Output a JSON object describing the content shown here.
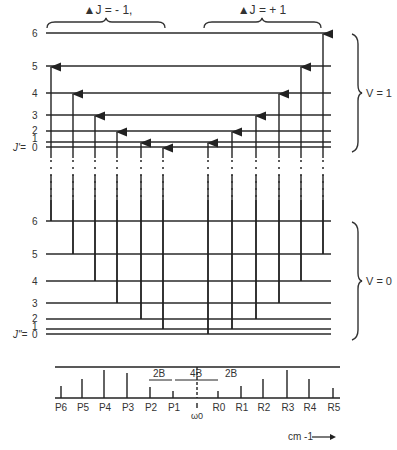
{
  "diagram": {
    "branch_labels": {
      "p_branch": "▲J = - 1,",
      "r_branch": "▲J = + 1"
    },
    "upper_state": {
      "label": "V = 1",
      "j_prefix": "J'=",
      "levels": [
        "6",
        "5",
        "4",
        "3",
        "2",
        "1",
        "0"
      ]
    },
    "lower_state": {
      "label": "V = 0",
      "j_prefix": "J\"=",
      "levels": [
        "6",
        "5",
        "4",
        "3",
        "2",
        "1",
        "0"
      ]
    },
    "spectrum": {
      "p_lines": [
        "P6",
        "P5",
        "P4",
        "P3",
        "P2",
        "P1"
      ],
      "r_lines": [
        "R0",
        "R1",
        "R2",
        "R3",
        "R4",
        "R5"
      ],
      "center_label": "ω0",
      "spacing_labels": [
        "2B",
        "4B",
        "2B"
      ],
      "axis_unit": "cm -1"
    },
    "colors": {
      "line": "#2a2a2a",
      "text": "#333333",
      "background": "#ffffff"
    }
  }
}
